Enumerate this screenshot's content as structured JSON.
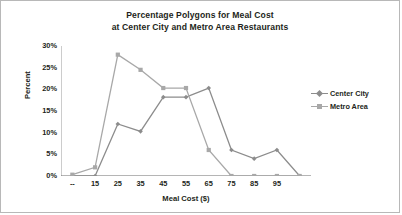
{
  "chart_data": {
    "type": "line",
    "title": "Percentage Polygons for Meal Cost at Center City and Metro Area Restaurants",
    "title_line1": "Percentage Polygons for Meal Cost",
    "title_line2": "at Center City and Metro Area Restaurants",
    "xlabel": "Meal Cost ($)",
    "ylabel": "Percent",
    "categories": [
      "--",
      "15",
      "25",
      "35",
      "45",
      "55",
      "65",
      "75",
      "85",
      "95",
      ""
    ],
    "x": [
      5,
      15,
      25,
      35,
      45,
      55,
      65,
      75,
      85,
      95,
      105
    ],
    "xlim": [
      0,
      110
    ],
    "ylim": [
      0,
      30
    ],
    "yticks": [
      0,
      5,
      10,
      15,
      20,
      25,
      30
    ],
    "ytick_labels": [
      "0%",
      "5%",
      "10%",
      "15%",
      "20%",
      "25%",
      "30%"
    ],
    "grid": false,
    "legend_position": "right",
    "series": [
      {
        "name": "Center City",
        "color": "#8c8c8c",
        "marker": "diamond",
        "values": [
          0,
          0,
          12,
          10.3,
          18.2,
          18.2,
          20.3,
          6,
          4,
          6,
          0
        ]
      },
      {
        "name": "Metro Area",
        "color": "#a8a8a8",
        "marker": "square",
        "values": [
          0.3,
          2,
          28,
          24.5,
          20.3,
          20.3,
          6,
          0,
          0,
          0,
          0
        ]
      }
    ]
  },
  "legend": {
    "items": [
      {
        "label": "Center City"
      },
      {
        "label": "Metro Area"
      }
    ]
  }
}
